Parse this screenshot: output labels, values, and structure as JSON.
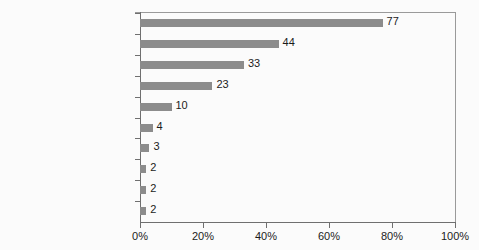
{
  "chart_data": {
    "type": "bar",
    "orientation": "horizontal",
    "title": "",
    "xlabel": "",
    "ylabel": "",
    "categories": [
      "Plants and paintings",
      "Office furniture",
      "Phones",
      "Computers",
      "Mouse pads",
      "Letterhead and envelopes",
      "Printer paper",
      "Notepads",
      "Post-its",
      "Pens/pencils"
    ],
    "values": [
      2,
      2,
      2,
      3,
      4,
      10,
      23,
      33,
      44,
      77
    ],
    "value_labels": [
      "2",
      "2",
      "2",
      "3",
      "4",
      "10",
      "23",
      "33",
      "44",
      "77"
    ],
    "xlim": [
      0,
      100
    ],
    "xticks": [
      0,
      20,
      40,
      60,
      80,
      100
    ],
    "xtick_labels": [
      "0%",
      "20%",
      "40%",
      "60%",
      "80%",
      "100%"
    ],
    "grid": false,
    "legend": false,
    "bar_color": "#8c8c8c",
    "axis_color": "#6f6f6f",
    "frame_color": "#9a9a9a",
    "background_color": "#fbfbfb",
    "text_color": "#1b1b1b"
  }
}
